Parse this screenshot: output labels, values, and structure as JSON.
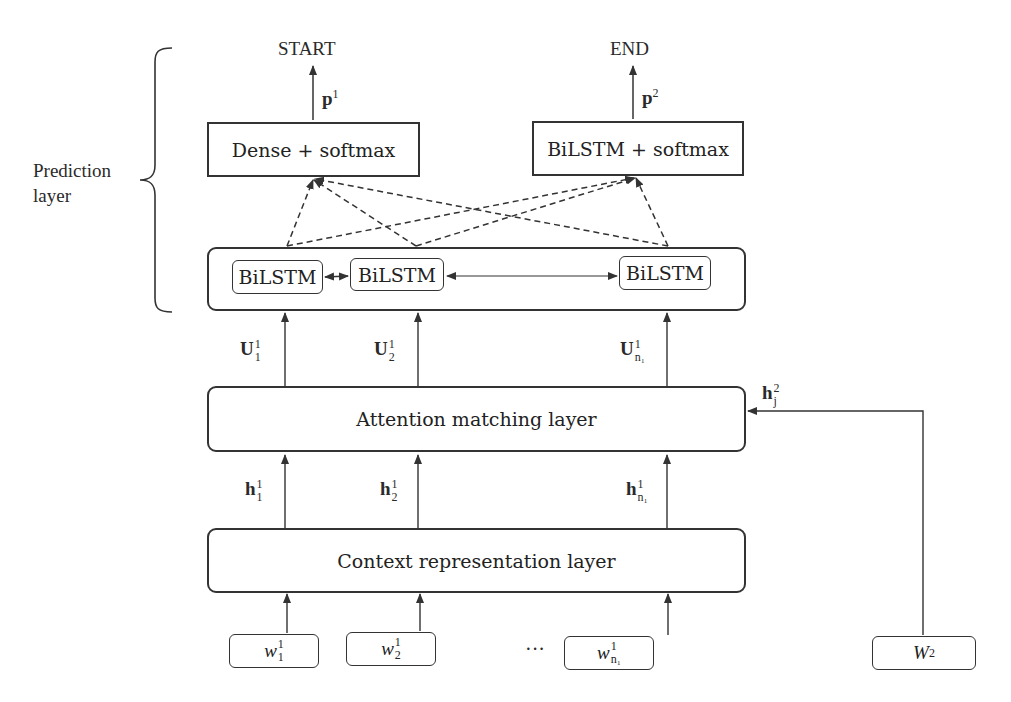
{
  "diagram": {
    "side_label": {
      "line1": "Prediction",
      "line2": "layer"
    },
    "outputs": {
      "start": "START",
      "end": "END",
      "p1": {
        "base": "p",
        "sup": "1"
      },
      "p2": {
        "base": "p",
        "sup": "2"
      }
    },
    "prediction_boxes": {
      "dense": "Dense + softmax",
      "bilstm_softmax": "BiLSTM + softmax"
    },
    "bilstm_cells": [
      "BiLSTM",
      "BiLSTM",
      "BiLSTM"
    ],
    "U_labels": [
      {
        "base": "U",
        "sup": "1",
        "sub": "1"
      },
      {
        "base": "U",
        "sup": "1",
        "sub": "2"
      },
      {
        "base": "U",
        "sup": "1",
        "sub": "n₁"
      }
    ],
    "attention_layer": "Attention matching layer",
    "h2_label": {
      "base": "h",
      "sup": "2",
      "sub": "j"
    },
    "h_labels": [
      {
        "base": "h",
        "sup": "1",
        "sub": "1"
      },
      {
        "base": "h",
        "sup": "1",
        "sub": "2"
      },
      {
        "base": "h",
        "sup": "1",
        "sub": "n₁"
      }
    ],
    "context_layer": "Context representation layer",
    "word_inputs": [
      {
        "base": "w",
        "sup": "1",
        "sub": "1"
      },
      {
        "base": "w",
        "sup": "1",
        "sub": "2"
      },
      {
        "base": "w",
        "sup": "1",
        "sub": "n₁"
      }
    ],
    "ellipsis": "···",
    "W2": {
      "base": "W",
      "sup": "2"
    }
  }
}
